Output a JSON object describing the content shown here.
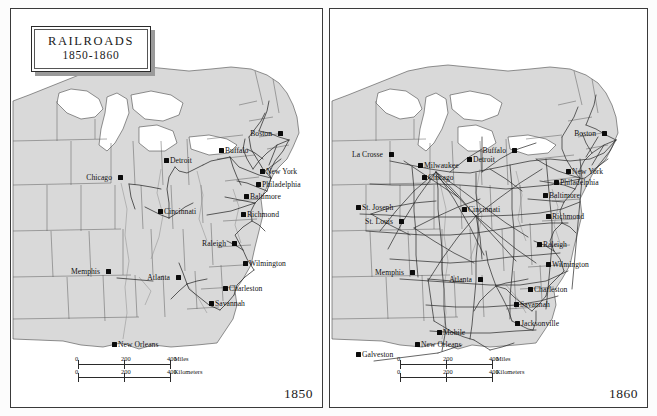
{
  "title": {
    "main": "RAILROADS",
    "years": "1850-1860"
  },
  "panels": [
    {
      "id": "1850",
      "year_label": "1850",
      "scalebar": {
        "miles": {
          "ticks": [
            "0",
            "200",
            "400"
          ],
          "unit": "Miles"
        },
        "kilometers": {
          "ticks": [
            "0",
            "200",
            "400"
          ],
          "unit": "Kilometers"
        }
      },
      "cities": [
        {
          "name": "Boston",
          "x": 278,
          "y": 131,
          "anchor": "l"
        },
        {
          "name": "Buffalo",
          "x": 219,
          "y": 148,
          "anchor": "r"
        },
        {
          "name": "Detroit",
          "x": 164,
          "y": 158,
          "anchor": "r"
        },
        {
          "name": "New York",
          "x": 260,
          "y": 169,
          "anchor": "r"
        },
        {
          "name": "Chicago",
          "x": 118,
          "y": 175,
          "anchor": "l"
        },
        {
          "name": "Philadelphia",
          "x": 256,
          "y": 182,
          "anchor": "r"
        },
        {
          "name": "Baltimore",
          "x": 244,
          "y": 194,
          "anchor": "r"
        },
        {
          "name": "Cincinnati",
          "x": 158,
          "y": 209,
          "anchor": "r"
        },
        {
          "name": "Richmond",
          "x": 241,
          "y": 212,
          "anchor": "r"
        },
        {
          "name": "Raleigh",
          "x": 232,
          "y": 241,
          "anchor": "l"
        },
        {
          "name": "Wilmington",
          "x": 243,
          "y": 261,
          "anchor": "r"
        },
        {
          "name": "Memphis",
          "x": 106,
          "y": 269,
          "anchor": "l"
        },
        {
          "name": "Atlanta",
          "x": 176,
          "y": 275,
          "anchor": "l"
        },
        {
          "name": "Charleston",
          "x": 223,
          "y": 286,
          "anchor": "r"
        },
        {
          "name": "Savannah",
          "x": 209,
          "y": 301,
          "anchor": "r"
        },
        {
          "name": "New Orleans",
          "x": 112,
          "y": 342,
          "anchor": "r"
        }
      ]
    },
    {
      "id": "1860",
      "year_label": "1860",
      "scalebar": {
        "miles": {
          "ticks": [
            "0",
            "200",
            "400"
          ],
          "unit": "Miles"
        },
        "kilometers": {
          "ticks": [
            "0",
            "200",
            "400"
          ],
          "unit": "Kilometers"
        }
      },
      "cities": [
        {
          "name": "Boston",
          "x": 602,
          "y": 131,
          "anchor": "l"
        },
        {
          "name": "Buffalo",
          "x": 512,
          "y": 148,
          "anchor": "l"
        },
        {
          "name": "La Crosse",
          "x": 389,
          "y": 152,
          "anchor": "l"
        },
        {
          "name": "Detroit",
          "x": 467,
          "y": 157,
          "anchor": "r"
        },
        {
          "name": "Milwaukee",
          "x": 418,
          "y": 163,
          "anchor": "r"
        },
        {
          "name": "New York",
          "x": 566,
          "y": 169,
          "anchor": "r"
        },
        {
          "name": "Chicago",
          "x": 422,
          "y": 175,
          "anchor": "r"
        },
        {
          "name": "Philadelphia",
          "x": 554,
          "y": 180,
          "anchor": "r"
        },
        {
          "name": "Baltimore",
          "x": 543,
          "y": 193,
          "anchor": "r"
        },
        {
          "name": "St. Joseph",
          "x": 356,
          "y": 205,
          "anchor": "r"
        },
        {
          "name": "Cincinnati",
          "x": 462,
          "y": 207,
          "anchor": "r"
        },
        {
          "name": "Richmond",
          "x": 546,
          "y": 214,
          "anchor": "r"
        },
        {
          "name": "St. Louis",
          "x": 399,
          "y": 219,
          "anchor": "l"
        },
        {
          "name": "Raleigh",
          "x": 537,
          "y": 242,
          "anchor": "r"
        },
        {
          "name": "Wilmington",
          "x": 546,
          "y": 262,
          "anchor": "r"
        },
        {
          "name": "Memphis",
          "x": 410,
          "y": 270,
          "anchor": "l"
        },
        {
          "name": "Atlanta",
          "x": 478,
          "y": 277,
          "anchor": "l"
        },
        {
          "name": "Charleston",
          "x": 528,
          "y": 287,
          "anchor": "r"
        },
        {
          "name": "Savannah",
          "x": 514,
          "y": 302,
          "anchor": "r"
        },
        {
          "name": "Jacksonville",
          "x": 515,
          "y": 321,
          "anchor": "r"
        },
        {
          "name": "Mobile",
          "x": 437,
          "y": 330,
          "anchor": "r"
        },
        {
          "name": "New Orleans",
          "x": 415,
          "y": 342,
          "anchor": "r"
        },
        {
          "name": "Galveston",
          "x": 356,
          "y": 352,
          "anchor": "r"
        }
      ]
    }
  ],
  "colors": {
    "land": "#d9d9d9",
    "water": "#ffffff",
    "border_line": "#5b5b5b",
    "coast_line": "#4a4a4a",
    "rail_line": "#2b2b2b",
    "city_dot": "#0b0b0b",
    "frame": "#3a3a3a"
  }
}
